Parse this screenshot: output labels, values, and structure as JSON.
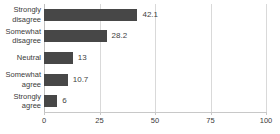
{
  "chart_data": {
    "type": "bar",
    "orientation": "horizontal",
    "title": "",
    "subtitle": "",
    "xlabel": "",
    "ylabel": "",
    "categories": [
      "Strongly disagree",
      "Somewhat disagree",
      "Neutral",
      "Somewhat agree",
      "Strongly agree"
    ],
    "category_lines": [
      [
        "Strongly",
        "disagree"
      ],
      [
        "Somewhat",
        "disagree"
      ],
      [
        "Neutral"
      ],
      [
        "Somewhat",
        "agree"
      ],
      [
        "Strongly",
        "agree"
      ]
    ],
    "values": [
      42.1,
      28.2,
      13,
      10.7,
      6
    ],
    "data_labels": [
      "42.1",
      "28.2",
      "13",
      "10.7",
      "6"
    ],
    "xlim": [
      0,
      100
    ],
    "xticks": [
      0,
      25,
      50,
      75,
      100
    ],
    "xtick_labels": [
      "0",
      "25",
      "50",
      "75",
      "100"
    ],
    "grid": true,
    "grid_axis": "x",
    "legend": false,
    "legend_position": "none",
    "colors": {
      "bar": "#474747",
      "gridline": "#d9d9d9",
      "axis": "#c8c8c8",
      "text": "#3a3a3a",
      "background": "#ffffff"
    }
  }
}
